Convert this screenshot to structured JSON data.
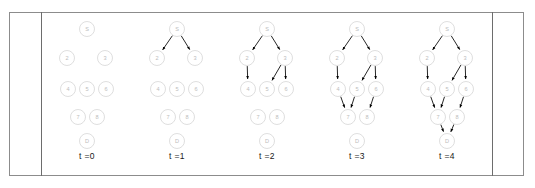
{
  "figure": {
    "kind": "graph-timeline",
    "background_color": "#ffffff",
    "frame_border_color": "#8c8c8c",
    "divider_color": "#6d6d6d",
    "node_stroke_color": "#d0d0d0",
    "node_fill_color": "#ffffff",
    "node_label_color": "#bdbdbd",
    "edge_color": "#000000"
  },
  "chart_data": {
    "type": "diagram",
    "title": "",
    "xlabel": "",
    "ylabel": "",
    "legend": [],
    "node_layout": [
      {
        "id": "S",
        "label": "S",
        "cx": 45,
        "cy": 16,
        "r": 7.5
      },
      {
        "id": "2",
        "label": "2",
        "cx": 25,
        "cy": 45,
        "r": 7.5
      },
      {
        "id": "3",
        "label": "3",
        "cx": 63,
        "cy": 45,
        "r": 7.5
      },
      {
        "id": "4",
        "label": "4",
        "cx": 26,
        "cy": 76,
        "r": 7.5
      },
      {
        "id": "5",
        "label": "5",
        "cx": 45,
        "cy": 76,
        "r": 7.5
      },
      {
        "id": "6",
        "label": "6",
        "cx": 64,
        "cy": 76,
        "r": 7.5
      },
      {
        "id": "7",
        "label": "7",
        "cx": 36,
        "cy": 104,
        "r": 7.5
      },
      {
        "id": "8",
        "label": "8",
        "cx": 55,
        "cy": 104,
        "r": 7.5
      },
      {
        "id": "D",
        "label": "D",
        "cx": 45,
        "cy": 128,
        "r": 7.5
      }
    ],
    "all_edges": [
      {
        "from": "S",
        "to": "2"
      },
      {
        "from": "S",
        "to": "3"
      },
      {
        "from": "2",
        "to": "4"
      },
      {
        "from": "3",
        "to": "5"
      },
      {
        "from": "3",
        "to": "6"
      },
      {
        "from": "4",
        "to": "7"
      },
      {
        "from": "5",
        "to": "7"
      },
      {
        "from": "6",
        "to": "8"
      },
      {
        "from": "7",
        "to": "D"
      },
      {
        "from": "8",
        "to": "D"
      }
    ],
    "frames": [
      {
        "time_label": "t =0",
        "x": 0,
        "edges": []
      },
      {
        "time_label": "t =1",
        "x": 90,
        "edges": [
          {
            "from": "S",
            "to": "2"
          },
          {
            "from": "S",
            "to": "3"
          }
        ]
      },
      {
        "time_label": "t =2",
        "x": 180,
        "edges": [
          {
            "from": "S",
            "to": "2"
          },
          {
            "from": "S",
            "to": "3"
          },
          {
            "from": "2",
            "to": "4"
          },
          {
            "from": "3",
            "to": "5"
          },
          {
            "from": "3",
            "to": "6"
          }
        ]
      },
      {
        "time_label": "t =3",
        "x": 270,
        "edges": [
          {
            "from": "S",
            "to": "2"
          },
          {
            "from": "S",
            "to": "3"
          },
          {
            "from": "2",
            "to": "4"
          },
          {
            "from": "3",
            "to": "5"
          },
          {
            "from": "3",
            "to": "6"
          },
          {
            "from": "4",
            "to": "7"
          },
          {
            "from": "5",
            "to": "7"
          },
          {
            "from": "6",
            "to": "8"
          }
        ]
      },
      {
        "time_label": "t =4",
        "x": 360,
        "edges": [
          {
            "from": "S",
            "to": "2"
          },
          {
            "from": "S",
            "to": "3"
          },
          {
            "from": "2",
            "to": "4"
          },
          {
            "from": "3",
            "to": "5"
          },
          {
            "from": "3",
            "to": "6"
          },
          {
            "from": "4",
            "to": "7"
          },
          {
            "from": "5",
            "to": "7"
          },
          {
            "from": "6",
            "to": "8"
          },
          {
            "from": "7",
            "to": "D"
          },
          {
            "from": "8",
            "to": "D"
          }
        ]
      }
    ]
  }
}
